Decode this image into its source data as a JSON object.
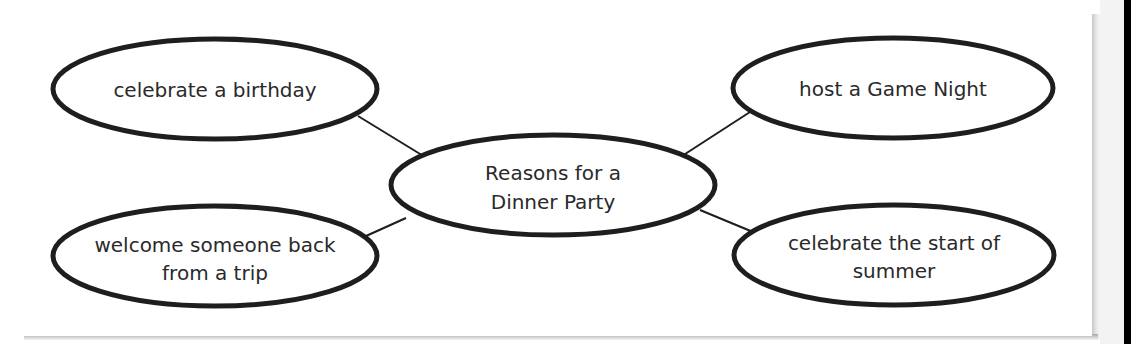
{
  "diagram": {
    "type": "web-organizer",
    "center": {
      "lines": [
        "Reasons for a",
        "Dinner Party"
      ]
    },
    "nodes": [
      {
        "position": "top-left",
        "lines": [
          "celebrate a birthday"
        ]
      },
      {
        "position": "top-right",
        "lines": [
          "host a Game Night"
        ]
      },
      {
        "position": "bottom-left",
        "lines": [
          "welcome someone back",
          "from a trip"
        ]
      },
      {
        "position": "bottom-right",
        "lines": [
          "celebrate the start of",
          "summer"
        ]
      }
    ],
    "colors": {
      "stroke": "#1e1e1e",
      "text": "#2a2a2a",
      "background": "#ffffff"
    }
  }
}
